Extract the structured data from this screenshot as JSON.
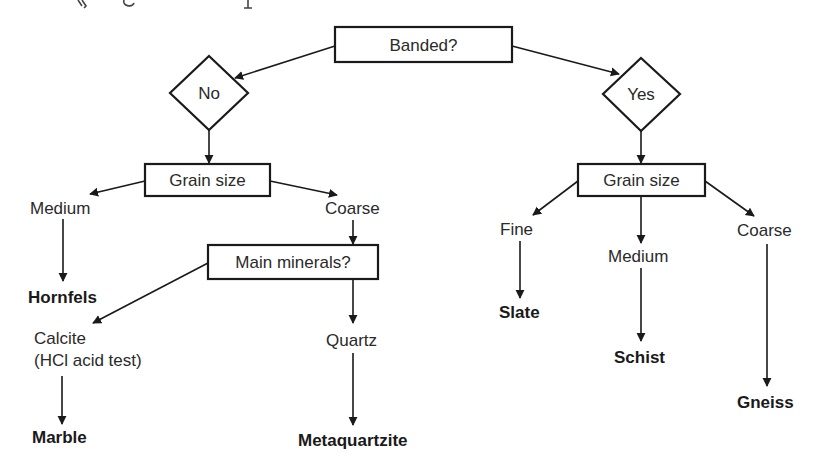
{
  "diagram": {
    "type": "decision-flowchart",
    "root": {
      "label": "Banded?"
    },
    "branches": {
      "no": {
        "label": "No",
        "question": "Grain size",
        "options": {
          "medium": {
            "label": "Medium",
            "result": "Hornfels"
          },
          "coarse": {
            "label": "Coarse",
            "question": "Main minerals?",
            "options": {
              "calcite": {
                "label": "Calcite",
                "sublabel": "(HCl acid test)",
                "result": "Marble"
              },
              "quartz": {
                "label": "Quartz",
                "result": "Metaquartzite"
              }
            }
          }
        }
      },
      "yes": {
        "label": "Yes",
        "question": "Grain size",
        "options": {
          "fine": {
            "label": "Fine",
            "result": "Slate"
          },
          "medium": {
            "label": "Medium",
            "result": "Schist"
          },
          "coarse": {
            "label": "Coarse",
            "result": "Gneiss"
          }
        }
      }
    },
    "colors": {
      "ink": "#1a1a1a",
      "background": "#ffffff"
    }
  }
}
